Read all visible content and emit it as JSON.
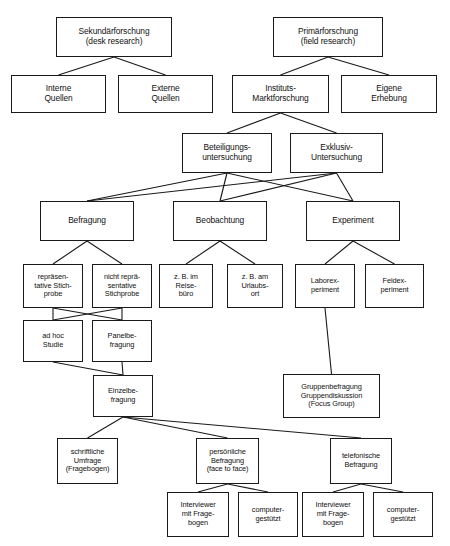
{
  "diagram": {
    "caption": "",
    "colors": {
      "box_border": "#1a1a1a",
      "box_fill": "#ffffff",
      "edge": "#1a1a1a",
      "background": "#ffffff"
    },
    "nodes": [
      {
        "id": "sekundaer",
        "label": "Sekundärforschung\n(desk research)",
        "x": 56,
        "y": 17,
        "w": 116,
        "h": 40,
        "size": "s10"
      },
      {
        "id": "primaer",
        "label": "Primärforschung\n(field research)",
        "x": 273,
        "y": 17,
        "w": 110,
        "h": 40,
        "size": "s10"
      },
      {
        "id": "interne",
        "label": "Interne\nQuellen",
        "x": 11,
        "y": 75,
        "w": 95,
        "h": 38,
        "size": "s10"
      },
      {
        "id": "externe",
        "label": "Externe\nQuellen",
        "x": 118,
        "y": 75,
        "w": 95,
        "h": 38,
        "size": "s10"
      },
      {
        "id": "instituts",
        "label": "Instituts-\nMarktforschung",
        "x": 232,
        "y": 75,
        "w": 97,
        "h": 38,
        "size": "s10"
      },
      {
        "id": "eigene",
        "label": "Eigene\nErhebung",
        "x": 341,
        "y": 75,
        "w": 96,
        "h": 38,
        "size": "s10"
      },
      {
        "id": "beteiligung",
        "label": "Beteiligungs-\nuntersuchung",
        "x": 182,
        "y": 133,
        "w": 90,
        "h": 40,
        "size": "s10"
      },
      {
        "id": "exklusiv",
        "label": "Exklusiv-\nUntersuchung",
        "x": 290,
        "y": 133,
        "w": 93,
        "h": 40,
        "size": "s10"
      },
      {
        "id": "befragung",
        "label": "Befragung",
        "x": 40,
        "y": 201,
        "w": 94,
        "h": 40,
        "size": "s10"
      },
      {
        "id": "beobachtung",
        "label": "Beobachtung",
        "x": 173,
        "y": 201,
        "w": 94,
        "h": 40,
        "size": "s10"
      },
      {
        "id": "experiment",
        "label": "Experiment",
        "x": 306,
        "y": 201,
        "w": 94,
        "h": 40,
        "size": "s10"
      },
      {
        "id": "repraes",
        "label": "repräsen-\ntative Stich-\nprobe",
        "x": 23,
        "y": 264,
        "w": 60,
        "h": 44,
        "size": "s85"
      },
      {
        "id": "nichtrepraes",
        "label": "nicht reprä-\nsentative\nStichprobe",
        "x": 92,
        "y": 264,
        "w": 60,
        "h": 44,
        "size": "s85"
      },
      {
        "id": "reisebuero",
        "label": "z. B. im\nReise-\nbüro",
        "x": 159,
        "y": 264,
        "w": 54,
        "h": 44,
        "size": "s85"
      },
      {
        "id": "urlaubsort",
        "label": "z. B. am\nUrlaubs-\nort",
        "x": 227,
        "y": 264,
        "w": 56,
        "h": 44,
        "size": "s85"
      },
      {
        "id": "labor",
        "label": "Laborex-\nperiment",
        "x": 295,
        "y": 264,
        "w": 60,
        "h": 44,
        "size": "s85"
      },
      {
        "id": "feld",
        "label": "Feldex-\nperiment",
        "x": 365,
        "y": 264,
        "w": 59,
        "h": 44,
        "size": "s85"
      },
      {
        "id": "adhoc",
        "label": "ad hoc\nStudie",
        "x": 23,
        "y": 320,
        "w": 60,
        "h": 42,
        "size": "s85"
      },
      {
        "id": "panel",
        "label": "Panelbe-\nfragung",
        "x": 92,
        "y": 320,
        "w": 60,
        "h": 42,
        "size": "s85"
      },
      {
        "id": "einzel",
        "label": "Einzelbe-\nfragung",
        "x": 93,
        "y": 375,
        "w": 60,
        "h": 42,
        "size": "s85"
      },
      {
        "id": "gruppe",
        "label": "Gruppenbefragung\nGruppendiskussion\n(Focus Group)",
        "x": 283,
        "y": 374,
        "w": 97,
        "h": 44,
        "size": "s85"
      },
      {
        "id": "schriftlich",
        "label": "schriftliche\nUmfrage\n(Fragebogen)",
        "x": 57,
        "y": 438,
        "w": 61,
        "h": 46,
        "size": "s85"
      },
      {
        "id": "persoenlich",
        "label": "persönliche\nBefragung\n(face to face)",
        "x": 196,
        "y": 438,
        "w": 63,
        "h": 46,
        "size": "s85"
      },
      {
        "id": "telefonisch",
        "label": "telefonische\nBefragung",
        "x": 330,
        "y": 438,
        "w": 62,
        "h": 46,
        "size": "s85"
      },
      {
        "id": "intv1",
        "label": "Interviewer\nmit Frage-\nbogen",
        "x": 167,
        "y": 492,
        "w": 62,
        "h": 45,
        "size": "s85"
      },
      {
        "id": "comp1",
        "label": "computer-\ngestützt",
        "x": 238,
        "y": 492,
        "w": 60,
        "h": 45,
        "size": "s85"
      },
      {
        "id": "intv2",
        "label": "Interviewer\nmit Frage-\nbogen",
        "x": 302,
        "y": 492,
        "w": 62,
        "h": 45,
        "size": "s85"
      },
      {
        "id": "comp2",
        "label": "computer-\ngestützt",
        "x": 373,
        "y": 492,
        "w": 60,
        "h": 45,
        "size": "s85"
      }
    ],
    "edges": [
      {
        "from": "sekundaer",
        "to": "interne"
      },
      {
        "from": "sekundaer",
        "to": "externe"
      },
      {
        "from": "primaer",
        "to": "instituts"
      },
      {
        "from": "primaer",
        "to": "eigene"
      },
      {
        "from": "instituts",
        "to": "beteiligung"
      },
      {
        "from": "instituts",
        "to": "exklusiv"
      },
      {
        "from": "beteiligung",
        "to": "befragung"
      },
      {
        "from": "beteiligung",
        "to": "beobachtung"
      },
      {
        "from": "beteiligung",
        "to": "experiment"
      },
      {
        "from": "exklusiv",
        "to": "befragung"
      },
      {
        "from": "exklusiv",
        "to": "beobachtung"
      },
      {
        "from": "exklusiv",
        "to": "experiment"
      },
      {
        "from": "befragung",
        "to": "repraes"
      },
      {
        "from": "befragung",
        "to": "nichtrepraes"
      },
      {
        "from": "beobachtung",
        "to": "reisebuero"
      },
      {
        "from": "beobachtung",
        "to": "urlaubsort"
      },
      {
        "from": "experiment",
        "to": "labor"
      },
      {
        "from": "experiment",
        "to": "feld"
      },
      {
        "from": "repraes",
        "to": "adhoc"
      },
      {
        "from": "repraes",
        "to": "panel"
      },
      {
        "from": "nichtrepraes",
        "to": "adhoc"
      },
      {
        "from": "nichtrepraes",
        "to": "panel"
      },
      {
        "from": "adhoc",
        "to": "einzel"
      },
      {
        "from": "panel",
        "to": "einzel"
      },
      {
        "from": "labor",
        "to": "gruppe"
      },
      {
        "from": "einzel",
        "to": "schriftlich"
      },
      {
        "from": "einzel",
        "to": "persoenlich"
      },
      {
        "from": "einzel",
        "to": "telefonisch"
      },
      {
        "from": "persoenlich",
        "to": "intv1"
      },
      {
        "from": "persoenlich",
        "to": "comp1"
      },
      {
        "from": "telefonisch",
        "to": "intv2"
      },
      {
        "from": "telefonisch",
        "to": "comp2"
      }
    ]
  }
}
